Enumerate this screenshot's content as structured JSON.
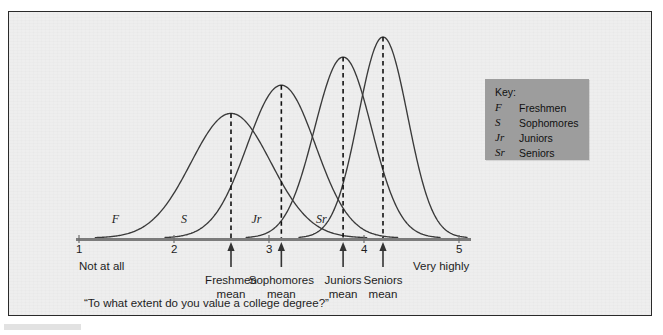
{
  "figure": {
    "caption": "“To what extent do you value a college degree?”",
    "background_color": "#eeeeee",
    "border_color": "#2a2a2a"
  },
  "key": {
    "title": "Key:",
    "background_color": "#9d9d9d",
    "entries": [
      {
        "abbr": "F",
        "name": "Freshmen"
      },
      {
        "abbr": "S",
        "name": "Sophomores"
      },
      {
        "abbr": "Jr",
        "name": "Juniors"
      },
      {
        "abbr": "Sr",
        "name": "Seniors"
      }
    ]
  },
  "axis": {
    "tick_labels": [
      "1",
      "2",
      "3",
      "4",
      "5"
    ],
    "low_anchor": "Not at all",
    "high_anchor": "Very highly"
  },
  "means": [
    {
      "line1": "Freshmen",
      "line2": "mean"
    },
    {
      "line1": "Sophomores",
      "line2": "mean"
    },
    {
      "line1": "Juniors",
      "line2": "mean"
    },
    {
      "line1": "Seniors",
      "line2": "mean"
    }
  ],
  "curve_labels": [
    {
      "text": "F"
    },
    {
      "text": "S"
    },
    {
      "text": "Jr"
    },
    {
      "text": "Sr"
    }
  ],
  "chart_data": {
    "type": "line",
    "title": "",
    "subtitle": "",
    "xlabel": "",
    "ylabel": "",
    "xlim": [
      1,
      5
    ],
    "ylim": [
      0,
      1
    ],
    "grid": false,
    "legend_position": "right",
    "xtick_values": [
      1,
      2,
      3,
      4,
      5
    ],
    "xtick_labels": [
      "1",
      "2",
      "3",
      "4",
      "5"
    ],
    "x_anchor_low": "Not at all",
    "x_anchor_high": "Very highly",
    "annotation": "“To what extent do you value a college degree?”",
    "series": [
      {
        "name": "Freshmen",
        "abbr": "F",
        "mean": 2.6,
        "mean_label": "Freshmen mean",
        "sd": 0.42,
        "peak_height": 0.62,
        "curve_label_x": 1.45
      },
      {
        "name": "Sophomores",
        "abbr": "S",
        "mean": 3.13,
        "mean_label": "Sophomores mean",
        "sd": 0.36,
        "peak_height": 0.76,
        "curve_label_x": 2.18
      },
      {
        "name": "Juniors",
        "abbr": "Jr",
        "mean": 3.78,
        "mean_label": "Juniors mean",
        "sd": 0.3,
        "peak_height": 0.9,
        "curve_label_x": 2.92
      },
      {
        "name": "Seniors",
        "abbr": "Sr",
        "mean": 4.2,
        "mean_label": "Seniors mean",
        "sd": 0.26,
        "peak_height": 1.0,
        "curve_label_x": 3.6
      }
    ]
  }
}
